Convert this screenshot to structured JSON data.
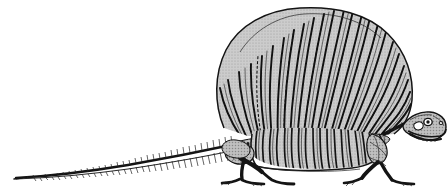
{
  "figure": {
    "orientation": "facing right",
    "background_color": "#ffffff",
    "canvas": {
      "width": 448,
      "height": 190
    },
    "caption": "",
    "label": ""
  },
  "palette": {
    "background": "#ffffff",
    "bone_fill": "#c9c9c9",
    "bone_fill_dark": "#b4b4b4",
    "bone_fill_light": "#d8d8d8",
    "ink": "#1a1a1a",
    "outline": "#141414"
  },
  "anatomy": {
    "sail": {
      "name": "dorsal sail of elongated neural spines",
      "spine_count": 24,
      "fill": "#c9c9c9",
      "apex_y": 8,
      "base_y": 132,
      "left_x": 216,
      "right_x": 412
    },
    "skull": {
      "name": "skull",
      "position": "upper right",
      "features": [
        "orbit",
        "naris",
        "jaw",
        "teeth"
      ]
    },
    "ribcage": {
      "name": "thoracic ribcage",
      "rib_count": 17,
      "fill": "#c9c9c9"
    },
    "tail": {
      "name": "caudal vertebral series with chevrons",
      "vertebra_count": 38,
      "tip_x": 14,
      "base_x": 236
    },
    "forelimb": {
      "name": "forelimb",
      "parts": [
        "humerus",
        "radius",
        "ulna",
        "manus"
      ]
    },
    "hindlimb": {
      "name": "hindlimb",
      "parts": [
        "femur",
        "tibia",
        "fibula",
        "pes"
      ]
    },
    "pelvis": {
      "name": "pelvic girdle"
    },
    "pectoral_girdle": {
      "name": "pectoral girdle with scapula and coracoid"
    }
  },
  "parts_list": [
    {
      "id": "sail",
      "label": "Dorsal sail"
    },
    {
      "id": "skull",
      "label": "Skull"
    },
    {
      "id": "ribcage",
      "label": "Ribcage"
    },
    {
      "id": "tail",
      "label": "Tail"
    },
    {
      "id": "forelimb",
      "label": "Forelimb"
    },
    {
      "id": "hindlimb",
      "label": "Hindlimb"
    }
  ]
}
